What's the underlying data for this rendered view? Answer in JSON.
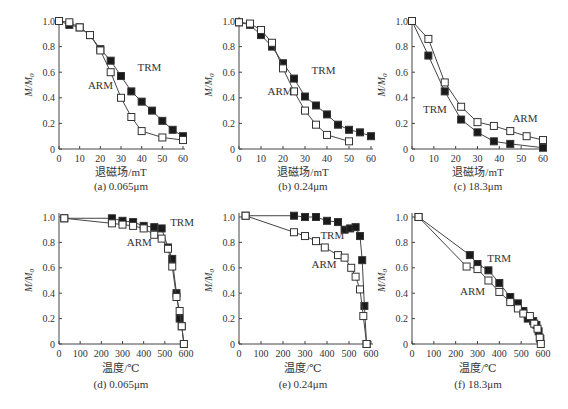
{
  "figure": {
    "caption_partial": "",
    "panel_captions": [
      "(a) 0.065μm",
      "(b) 0.24μm",
      "(c) 18.3μm",
      "(d) 0.065μm",
      "(e) 0.24μm",
      "(f) 18.3μm"
    ]
  },
  "chart_data": [
    {
      "id": "a",
      "type": "line",
      "title": "(a) 0.065μm",
      "xlabel": "退磁场/mT",
      "ylabel": "M/M0",
      "xlim": [
        0,
        60
      ],
      "ylim": [
        0,
        1.0
      ],
      "xticks": [
        0,
        10,
        20,
        30,
        40,
        50,
        60
      ],
      "yticks": [
        0,
        0.2,
        0.4,
        0.6,
        0.8,
        1.0
      ],
      "series": [
        {
          "name": "TRM",
          "marker": "filled-square",
          "x": [
            0,
            5,
            10,
            15,
            20,
            25,
            30,
            35,
            40,
            45,
            50,
            55,
            60
          ],
          "y": [
            1.0,
            0.97,
            0.95,
            0.89,
            0.78,
            0.69,
            0.57,
            0.45,
            0.37,
            0.3,
            0.22,
            0.15,
            0.1
          ]
        },
        {
          "name": "ARM",
          "marker": "open-square",
          "x": [
            0,
            5,
            10,
            15,
            20,
            25,
            30,
            35,
            40,
            50,
            60
          ],
          "y": [
            1.0,
            0.99,
            0.95,
            0.89,
            0.77,
            0.6,
            0.4,
            0.25,
            0.14,
            0.09,
            0.07
          ]
        }
      ],
      "labels": [
        {
          "text": "TRM",
          "x": 35,
          "y": 0.63
        },
        {
          "text": "ARM",
          "x": 15,
          "y": 0.52
        }
      ],
      "label_positions": {
        "TRM": [
          38,
          0.64
        ],
        "ARM": [
          14,
          0.5
        ]
      }
    },
    {
      "id": "b",
      "type": "line",
      "title": "(b) 0.24μm",
      "xlabel": "退磁场/mT",
      "ylabel": "M/M0",
      "xlim": [
        0,
        60
      ],
      "ylim": [
        0,
        1.0
      ],
      "xticks": [
        0,
        10,
        20,
        30,
        40,
        50,
        60
      ],
      "yticks": [
        0,
        0.2,
        0.4,
        0.6,
        0.8,
        1.0
      ],
      "series": [
        {
          "name": "TRM",
          "marker": "filled-square",
          "x": [
            0,
            5,
            10,
            15,
            20,
            25,
            30,
            35,
            40,
            45,
            50,
            55,
            60
          ],
          "y": [
            0.99,
            0.97,
            0.89,
            0.8,
            0.67,
            0.55,
            0.41,
            0.34,
            0.27,
            0.19,
            0.15,
            0.13,
            0.1
          ]
        },
        {
          "name": "ARM",
          "marker": "open-square",
          "x": [
            0,
            5,
            10,
            15,
            20,
            25,
            30,
            35,
            40,
            50
          ],
          "y": [
            0.99,
            0.98,
            0.93,
            0.83,
            0.63,
            0.45,
            0.3,
            0.19,
            0.11,
            0.06
          ]
        }
      ],
      "label_positions": {
        "TRM": [
          33,
          0.62
        ],
        "ARM": [
          13,
          0.45
        ]
      }
    },
    {
      "id": "c",
      "type": "line",
      "title": "(c) 18.3μm",
      "xlabel": "退磁场/mT",
      "ylabel": "M/M0",
      "xlim": [
        0,
        60
      ],
      "ylim": [
        0,
        1.0
      ],
      "xticks": [
        0,
        10,
        20,
        30,
        40,
        50,
        60
      ],
      "yticks": [
        0,
        0.2,
        0.4,
        0.6,
        0.8,
        1.0
      ],
      "series": [
        {
          "name": "TRM",
          "marker": "filled-square",
          "x": [
            0,
            7.5,
            15,
            22.5,
            30,
            37.5,
            45,
            60
          ],
          "y": [
            1.0,
            0.73,
            0.45,
            0.23,
            0.13,
            0.06,
            0.04,
            0.01
          ]
        },
        {
          "name": "ARM",
          "marker": "open-square",
          "x": [
            0,
            7.5,
            15,
            22.5,
            30,
            37.5,
            45,
            52.5,
            60
          ],
          "y": [
            1.0,
            0.86,
            0.52,
            0.33,
            0.21,
            0.18,
            0.14,
            0.1,
            0.07
          ]
        }
      ],
      "label_positions": {
        "TRM": [
          5,
          0.31
        ],
        "ARM": [
          46,
          0.24
        ]
      }
    },
    {
      "id": "d",
      "type": "line",
      "title": "(d) 0.065μm",
      "xlabel": "温度/℃",
      "ylabel": "M/M0",
      "xlim": [
        0,
        600
      ],
      "ylim": [
        0,
        1.0
      ],
      "xticks": [
        0,
        100,
        200,
        300,
        400,
        500,
        600
      ],
      "yticks": [
        0,
        0.2,
        0.4,
        0.6,
        0.8,
        1.0
      ],
      "series": [
        {
          "name": "TRM",
          "marker": "filled-square",
          "x": [
            25,
            250,
            300,
            350,
            400,
            450,
            485,
            515,
            535,
            555,
            570,
            580,
            590
          ],
          "y": [
            0.99,
            0.99,
            0.97,
            0.96,
            0.93,
            0.92,
            0.91,
            0.76,
            0.67,
            0.4,
            0.2,
            0.14,
            0.0
          ]
        },
        {
          "name": "ARM",
          "marker": "open-square",
          "x": [
            25,
            250,
            300,
            350,
            400,
            450,
            485,
            515,
            535,
            555,
            570,
            580,
            590
          ],
          "y": [
            0.99,
            0.95,
            0.94,
            0.93,
            0.91,
            0.86,
            0.83,
            0.75,
            0.61,
            0.37,
            0.26,
            0.14,
            0.0
          ]
        }
      ],
      "label_positions": {
        "TRM": [
          525,
          0.96
        ],
        "ARM": [
          320,
          0.8
        ]
      }
    },
    {
      "id": "e",
      "type": "line",
      "title": "(e) 0.24μm",
      "xlabel": "温度/℃",
      "ylabel": "M/M0",
      "xlim": [
        0,
        600
      ],
      "ylim": [
        0,
        1.0
      ],
      "xticks": [
        0,
        100,
        200,
        300,
        400,
        500,
        600
      ],
      "yticks": [
        0,
        0.2,
        0.4,
        0.6,
        0.8,
        1.0
      ],
      "series": [
        {
          "name": "TRM",
          "marker": "filled-square",
          "x": [
            30,
            250,
            300,
            350,
            400,
            450,
            480,
            505,
            530,
            550,
            560,
            570,
            580
          ],
          "y": [
            1.01,
            1.01,
            1.0,
            1.0,
            0.97,
            0.96,
            0.9,
            0.91,
            0.92,
            0.85,
            0.66,
            0.3,
            0.0
          ]
        },
        {
          "name": "ARM",
          "marker": "open-square",
          "x": [
            30,
            250,
            300,
            350,
            390,
            450,
            480,
            510,
            530,
            550,
            565,
            580
          ],
          "y": [
            1.01,
            0.88,
            0.85,
            0.81,
            0.76,
            0.7,
            0.68,
            0.6,
            0.53,
            0.43,
            0.22,
            0.0
          ]
        }
      ],
      "label_positions": {
        "TRM": [
          370,
          0.86
        ],
        "ARM": [
          330,
          0.63
        ]
      }
    },
    {
      "id": "f",
      "type": "line",
      "title": "(f) 18.3μm",
      "xlabel": "温度/℃",
      "ylabel": "M/M0",
      "xlim": [
        0,
        600
      ],
      "ylim": [
        0,
        1.0
      ],
      "xticks": [
        0,
        100,
        200,
        300,
        400,
        500,
        600
      ],
      "yticks": [
        0,
        0.2,
        0.4,
        0.6,
        0.8,
        1.0
      ],
      "series": [
        {
          "name": "TRM",
          "marker": "filled-square",
          "x": [
            30,
            265,
            300,
            350,
            400,
            450,
            485,
            510,
            530,
            555,
            570,
            580,
            588
          ],
          "y": [
            1.0,
            0.7,
            0.63,
            0.58,
            0.48,
            0.37,
            0.32,
            0.26,
            0.2,
            0.18,
            0.15,
            0.1,
            0.04
          ]
        },
        {
          "name": "ARM",
          "marker": "open-square",
          "x": [
            30,
            250,
            300,
            350,
            400,
            450,
            485,
            510,
            540,
            560,
            575,
            585,
            590
          ],
          "y": [
            1.0,
            0.61,
            0.59,
            0.5,
            0.41,
            0.33,
            0.28,
            0.24,
            0.22,
            0.16,
            0.12,
            0.05,
            0.0
          ]
        }
      ],
      "label_positions": {
        "TRM": [
          345,
          0.68
        ],
        "ARM": [
          220,
          0.42
        ]
      }
    }
  ]
}
